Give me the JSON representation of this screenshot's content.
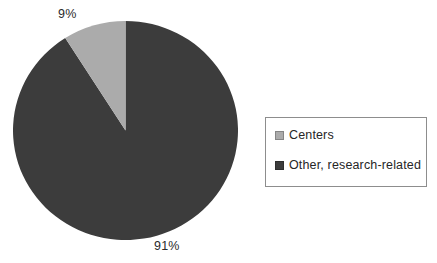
{
  "chart_data": {
    "type": "pie",
    "title": "",
    "subtitle": "",
    "xlabel": "",
    "ylabel": "",
    "grid": false,
    "legend_position": "right",
    "start_angle_deg": 90,
    "direction": "counterclockwise",
    "categories": [
      "Centers",
      "Other, research-related"
    ],
    "values": [
      9,
      91
    ],
    "value_unit": "%",
    "data_labels": [
      "9%",
      "91%"
    ],
    "colors": [
      "#ababab",
      "#3c3c3c"
    ],
    "slices": [
      {
        "label": "Centers",
        "value": 9,
        "data_label": "9%",
        "color": "#ababab",
        "angle_deg": 32.4
      },
      {
        "label": "Other, research-related",
        "value": 91,
        "data_label": "91%",
        "color": "#3c3c3c",
        "angle_deg": 327.6
      }
    ]
  },
  "labels": {
    "centers_pct": "9%",
    "other_pct": "91%"
  },
  "legend": {
    "items": [
      {
        "label": "Centers",
        "color": "#ababab"
      },
      {
        "label": "Other, research-related",
        "color": "#3c3c3c"
      }
    ]
  },
  "style": {
    "background": "#ffffff",
    "legend_border": "#8d8d8d",
    "label_text": "#2b2b2b"
  }
}
